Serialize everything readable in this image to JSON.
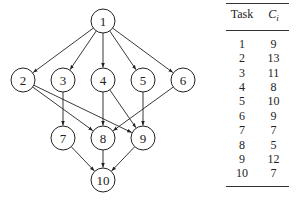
{
  "graph": {
    "nodes": [
      {
        "id": "1",
        "x": 103,
        "y": 21
      },
      {
        "id": "2",
        "x": 23,
        "y": 80
      },
      {
        "id": "3",
        "x": 63,
        "y": 80
      },
      {
        "id": "4",
        "x": 103,
        "y": 80
      },
      {
        "id": "5",
        "x": 143,
        "y": 80
      },
      {
        "id": "6",
        "x": 183,
        "y": 80
      },
      {
        "id": "7",
        "x": 63,
        "y": 138
      },
      {
        "id": "8",
        "x": 103,
        "y": 138
      },
      {
        "id": "9",
        "x": 143,
        "y": 138
      },
      {
        "id": "10",
        "x": 103,
        "y": 180
      }
    ],
    "edges": [
      [
        "1",
        "2"
      ],
      [
        "1",
        "3"
      ],
      [
        "1",
        "4"
      ],
      [
        "1",
        "5"
      ],
      [
        "1",
        "6"
      ],
      [
        "2",
        "8"
      ],
      [
        "2",
        "9"
      ],
      [
        "3",
        "7"
      ],
      [
        "4",
        "8"
      ],
      [
        "4",
        "9"
      ],
      [
        "5",
        "9"
      ],
      [
        "6",
        "8"
      ],
      [
        "7",
        "10"
      ],
      [
        "8",
        "10"
      ],
      [
        "9",
        "10"
      ]
    ],
    "node_radius": 12
  },
  "table": {
    "headers": {
      "task": "Task",
      "ci": "C",
      "ci_sub": "i"
    },
    "rows": [
      {
        "task": "1",
        "c": "9"
      },
      {
        "task": "2",
        "c": "13"
      },
      {
        "task": "3",
        "c": "11"
      },
      {
        "task": "4",
        "c": "8"
      },
      {
        "task": "5",
        "c": "10"
      },
      {
        "task": "6",
        "c": "9"
      },
      {
        "task": "7",
        "c": "7"
      },
      {
        "task": "8",
        "c": "5"
      },
      {
        "task": "9",
        "c": "12"
      },
      {
        "task": "10",
        "c": "7"
      }
    ]
  }
}
